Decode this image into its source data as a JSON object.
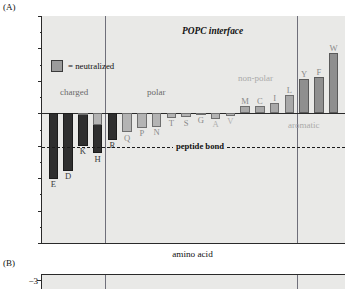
{
  "figure": {
    "panelA_letter": "(A)",
    "panelB_letter": "(B)"
  },
  "chart_data": {
    "type": "bar",
    "title": "POPC interface",
    "xlabel": "amino acid",
    "ylabel": "ΔG (from water, kcal mol",
    "ylabel_sup": "−1",
    "ylabel_close": ")",
    "ylim": [
      -3,
      4
    ],
    "y_inverted": true,
    "yticks": [
      -3,
      -2,
      -1,
      0,
      1,
      2,
      3,
      4
    ],
    "ytick_labels": [
      "−3",
      "−2",
      "−1",
      "0",
      "1",
      "2",
      "3",
      "4"
    ],
    "grid": false,
    "legend": {
      "position": "upper-left-inside",
      "entries": [
        {
          "label": "= neutralized",
          "swatch_color": "#9b9b9b"
        }
      ]
    },
    "annotations": [
      {
        "name": "peptide-bond-line",
        "type": "hline",
        "value": 1.05,
        "label": "peptide bond",
        "style": "dashed"
      },
      {
        "name": "group-charged",
        "type": "text",
        "label": "charged",
        "value": -0.62,
        "color": "#6a6a6a"
      },
      {
        "name": "group-polar",
        "type": "text",
        "label": "polar",
        "value": -0.62,
        "color": "#6a6a6a"
      },
      {
        "name": "group-nonpolar",
        "type": "text",
        "label": "non-polar",
        "value": -1.05,
        "color": "#a9a9a9"
      },
      {
        "name": "group-aromatic",
        "type": "text",
        "label": "aromatic",
        "value": 0.38,
        "color": "#a9a9a9"
      }
    ],
    "group_separators": [
      3.5,
      16.5
    ],
    "categories": [
      "E",
      "D",
      "K",
      "H",
      "R",
      "Q",
      "P",
      "N",
      "T",
      "S",
      "G",
      "A",
      "V",
      "M",
      "C",
      "I",
      "L",
      "Y",
      "F",
      "W"
    ],
    "values": [
      2.02,
      1.77,
      1.0,
      1.23,
      0.82,
      0.58,
      0.45,
      0.42,
      0.14,
      0.13,
      0.01,
      0.17,
      0.07,
      -0.23,
      -0.24,
      -0.31,
      -0.56,
      -1.05,
      -1.13,
      -1.85
    ],
    "neutralized_values": [
      null,
      null,
      0.0,
      0.35,
      null,
      null,
      null,
      null,
      null,
      null,
      null,
      null,
      null,
      null,
      null,
      null,
      null,
      null,
      null,
      null
    ],
    "bars": [
      {
        "label": "E",
        "value": 2.02,
        "group": "charged",
        "color": "#2f2f2f",
        "label_color": "#3b3b3b"
      },
      {
        "label": "D",
        "value": 1.77,
        "group": "charged",
        "color": "#2f2f2f",
        "label_color": "#3b3b3b"
      },
      {
        "label": "K",
        "value": 1.0,
        "group": "charged",
        "color": "#2f2f2f",
        "label_color": "#3b3b3b",
        "neutralized": 0.0
      },
      {
        "label": "H",
        "value": 1.23,
        "group": "charged",
        "color": "#2f2f2f",
        "label_color": "#3b3b3b",
        "neutralized": 0.35
      },
      {
        "label": "R",
        "value": 0.82,
        "group": "charged",
        "color": "#2f2f2f",
        "label_color": "#3b3b3b"
      },
      {
        "label": "Q",
        "value": 0.58,
        "group": "polar",
        "color": "#b4b4b4",
        "label_color": "#8a8a8a"
      },
      {
        "label": "P",
        "value": 0.45,
        "group": "polar",
        "color": "#b4b4b4",
        "label_color": "#8a8a8a"
      },
      {
        "label": "N",
        "value": 0.42,
        "group": "polar",
        "color": "#b4b4b4",
        "label_color": "#8a8a8a"
      },
      {
        "label": "T",
        "value": 0.14,
        "group": "polar",
        "color": "#b4b4b4",
        "label_color": "#8a8a8a"
      },
      {
        "label": "S",
        "value": 0.13,
        "group": "polar",
        "color": "#b4b4b4",
        "label_color": "#8a8a8a"
      },
      {
        "label": "G",
        "value": 0.01,
        "group": "polar",
        "color": "#b4b4b4",
        "label_color": "#8a8a8a"
      },
      {
        "label": "A",
        "value": 0.17,
        "group": "polar",
        "color": "#b4b4b4",
        "label_color": "#b0b0b0"
      },
      {
        "label": "V",
        "value": 0.07,
        "group": "polar",
        "color": "#b4b4b4",
        "label_color": "#b0b0b0"
      },
      {
        "label": "M",
        "value": -0.23,
        "group": "nonpolar",
        "color": "#a8a8a8",
        "label_color": "#8a8a8a"
      },
      {
        "label": "C",
        "value": -0.24,
        "group": "nonpolar",
        "color": "#a8a8a8",
        "label_color": "#8a8a8a"
      },
      {
        "label": "I",
        "value": -0.31,
        "group": "nonpolar",
        "color": "#a8a8a8",
        "label_color": "#8a8a8a"
      },
      {
        "label": "L",
        "value": -0.56,
        "group": "nonpolar",
        "color": "#a8a8a8",
        "label_color": "#8a8a8a"
      },
      {
        "label": "Y",
        "value": -1.05,
        "group": "aromatic",
        "color": "#8f8f8f",
        "label_color": "#8a8a8a"
      },
      {
        "label": "F",
        "value": -1.13,
        "group": "aromatic",
        "color": "#8f8f8f",
        "label_color": "#8a8a8a"
      },
      {
        "label": "W",
        "value": -1.85,
        "group": "aromatic",
        "color": "#8f8f8f",
        "label_color": "#8a8a8a"
      }
    ]
  },
  "panelB": {
    "ytick_label": "−3"
  }
}
